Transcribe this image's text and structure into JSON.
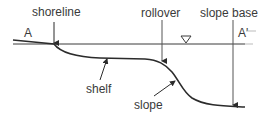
{
  "diagram": {
    "labels": {
      "shoreline": "shoreline",
      "rollover": "rollover",
      "slope_base": "slope base",
      "shelf": "shelf",
      "slope": "slope",
      "section_start": "A",
      "section_end": "A'"
    },
    "icons": {
      "water_level": "inverted-triangle-water-level-symbol"
    },
    "colors": {
      "line": "#2b2b2b",
      "text": "#3a3a3a",
      "thin_line": "#555555",
      "faint": "#bbbbbb"
    }
  }
}
